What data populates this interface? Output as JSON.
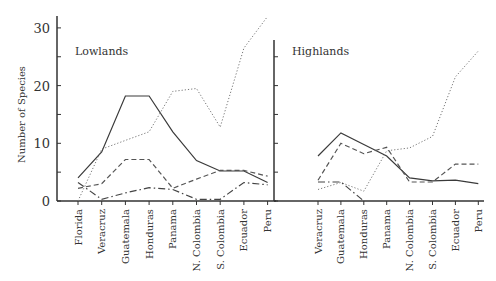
{
  "chart_data": [
    {
      "type": "line",
      "title": "Lowlands",
      "ylabel": "Number of Species",
      "xlabel": "",
      "ylim": [
        0,
        32
      ],
      "yticks": [
        0,
        10,
        20,
        30
      ],
      "grid": false,
      "categories": [
        "Florida",
        "Veracruz",
        "Guatemala",
        "Honduras",
        "Panama",
        "N. Colombia",
        "S. Colombia",
        "Ecuador",
        "Peru"
      ],
      "series": [
        {
          "name": "solid",
          "style": "solid",
          "values": [
            4,
            8.5,
            18.2,
            18.2,
            12,
            7,
            5.2,
            5.2,
            3.2
          ]
        },
        {
          "name": "dotted",
          "style": "dotted",
          "values": [
            0,
            9,
            10.5,
            12,
            19,
            19.5,
            12.8,
            26.5,
            32
          ]
        },
        {
          "name": "dashed",
          "style": "dashed",
          "values": [
            2.2,
            3,
            7.2,
            7.2,
            2.2,
            3.8,
            5.3,
            5.3,
            4.3
          ]
        },
        {
          "name": "dash-dot",
          "style": "dashdot",
          "values": [
            3.2,
            0.3,
            1.4,
            2.3,
            2.0,
            0.3,
            0.3,
            3.2,
            2.8
          ]
        }
      ]
    },
    {
      "type": "line",
      "title": "Highlands",
      "ylabel": "",
      "xlabel": "",
      "ylim": [
        0,
        32
      ],
      "grid": false,
      "categories": [
        "Veracruz",
        "Guatemala",
        "Honduras",
        "Panama",
        "N. Colombia",
        "S. Colombia",
        "Ecuador",
        "Peru"
      ],
      "series": [
        {
          "name": "solid",
          "style": "solid",
          "values": [
            7.8,
            11.8,
            9.8,
            7.8,
            4,
            3.5,
            3.6,
            3
          ]
        },
        {
          "name": "dotted",
          "style": "dotted",
          "values": [
            2,
            3.2,
            1.7,
            8.7,
            9.2,
            11.2,
            21.5,
            26
          ]
        },
        {
          "name": "dashed",
          "style": "dashed",
          "values": [
            3.6,
            10,
            8.2,
            9.3,
            3.3,
            3.3,
            6.4,
            6.4
          ]
        },
        {
          "name": "dash-dot",
          "style": "dashdot",
          "values": [
            3.3,
            3.3,
            0,
            null,
            null,
            null,
            null,
            null
          ]
        }
      ]
    }
  ],
  "labels": {
    "y_axis_title": "Number of Species",
    "panel_left_title": "Lowlands",
    "panel_right_title": "Highlands",
    "y_ticks": [
      "0",
      "10",
      "20",
      "30"
    ]
  },
  "caption": ""
}
